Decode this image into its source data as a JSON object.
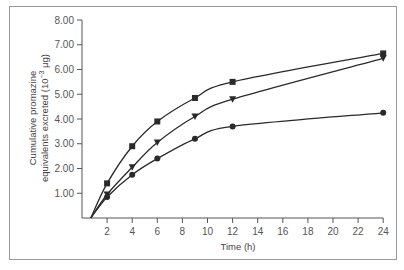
{
  "chart_data": {
    "type": "line",
    "title": "",
    "xlabel": "Time (h)",
    "ylabel_line1": "Cumulative promazine",
    "ylabel_line2": "equivalents excreted (10",
    "ylabel_exp": "−3",
    "ylabel_unit": " μg)",
    "ylabel": "Cumulative promazine equivalents excreted (10^-3 μg)",
    "xlim": [
      0,
      24
    ],
    "ylim": [
      0,
      8
    ],
    "x_ticks": [
      2,
      4,
      6,
      8,
      10,
      12,
      14,
      16,
      18,
      20,
      22,
      24
    ],
    "y_ticks": [
      "1.00",
      "2.00",
      "3.00",
      "4.00",
      "5.00",
      "6.00",
      "7.00",
      "8.00"
    ],
    "grid": false,
    "legend": null,
    "x": [
      2,
      4,
      6,
      9,
      12,
      24
    ],
    "series": [
      {
        "name": "square-markers",
        "marker": "square",
        "values": [
          1.4,
          2.9,
          3.9,
          4.85,
          5.5,
          6.65
        ]
      },
      {
        "name": "triangle-markers",
        "marker": "triangle-down",
        "values": [
          0.95,
          2.05,
          3.05,
          4.1,
          4.8,
          6.45
        ]
      },
      {
        "name": "circle-markers",
        "marker": "circle",
        "values": [
          0.85,
          1.75,
          2.4,
          3.2,
          3.7,
          4.25
        ]
      }
    ],
    "curve_origin_x": 0.7
  },
  "colors": {
    "line": "#2a2a2a",
    "axis": "#555555",
    "frame": "#9a9a9a"
  }
}
